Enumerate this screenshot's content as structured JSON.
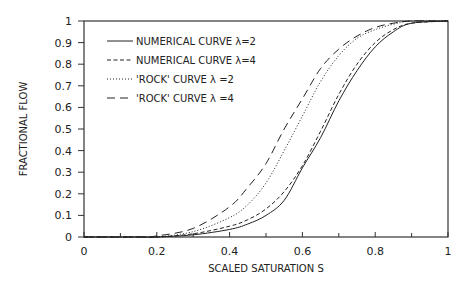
{
  "chart_data": {
    "type": "line",
    "title": "",
    "xlabel": "SCALED SATURATION S",
    "ylabel": "FRACTIONAL FLOW",
    "xlim": [
      0,
      1
    ],
    "ylim": [
      0,
      1
    ],
    "grid": false,
    "legend_position": "upper-left",
    "x_ticks": [
      "0",
      "0.2",
      "0.4",
      "0.6",
      "0.8",
      "1"
    ],
    "y_ticks": [
      "0",
      "0.1",
      "0.2",
      "0.3",
      "0.4",
      "0.5",
      "0.6",
      "0.7",
      "0.8",
      "0.9",
      "1"
    ],
    "x": [
      0.2,
      0.3,
      0.4,
      0.45,
      0.5,
      0.55,
      0.6,
      0.65,
      0.7,
      0.75,
      0.8,
      0.85,
      0.9,
      1.0
    ],
    "series": [
      {
        "name": "NUMERICAL CURVE λ=2",
        "style": "solid",
        "values": [
          0.0,
          0.01,
          0.035,
          0.06,
          0.1,
          0.17,
          0.32,
          0.46,
          0.63,
          0.77,
          0.88,
          0.95,
          0.99,
          1.0
        ]
      },
      {
        "name": "NUMERICAL CURVE λ=4",
        "style": "short-dash",
        "values": [
          0.0,
          0.015,
          0.05,
          0.08,
          0.13,
          0.21,
          0.33,
          0.49,
          0.66,
          0.8,
          0.9,
          0.96,
          0.99,
          1.0
        ]
      },
      {
        "name": "'ROCK' CURVE λ =2",
        "style": "dotted",
        "values": [
          0.0,
          0.025,
          0.09,
          0.15,
          0.25,
          0.4,
          0.56,
          0.72,
          0.84,
          0.92,
          0.96,
          0.985,
          1.0,
          1.0
        ]
      },
      {
        "name": "'ROCK' CURVE λ =4",
        "style": "long-dash",
        "values": [
          0.005,
          0.04,
          0.14,
          0.23,
          0.34,
          0.5,
          0.64,
          0.78,
          0.87,
          0.93,
          0.97,
          0.99,
          1.0,
          1.0
        ]
      }
    ]
  },
  "legend": {
    "items": [
      {
        "label": "NUMERICAL CURVE λ=2"
      },
      {
        "label": "NUMERICAL CURVE λ=4"
      },
      {
        "label": "'ROCK' CURVE λ =2"
      },
      {
        "label": "'ROCK' CURVE λ =4"
      }
    ]
  },
  "colors": {
    "line": "#222222",
    "axis": "#333333",
    "background": "#ffffff"
  }
}
